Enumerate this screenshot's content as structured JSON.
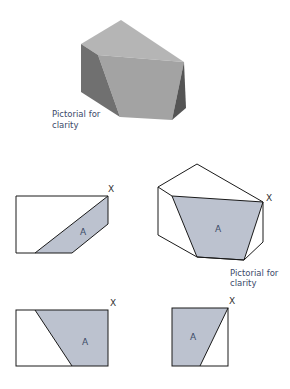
{
  "pictorial": {
    "caption_line1": "Pictorial for",
    "caption_line2": "clarity",
    "colors": {
      "top": "#b3b3b3",
      "front": "#a6a6a6",
      "left": "#6e6e6e",
      "right": "#5a5a5a"
    }
  },
  "views": {
    "front_view": {
      "area_label": "A",
      "corner_label": "X"
    },
    "isometric_view": {
      "area_label": "A",
      "corner_label": "X",
      "caption_line1": "Pictorial for",
      "caption_line2": "clarity"
    },
    "plan_view": {
      "area_label": "A",
      "corner_label": "X"
    },
    "end_view": {
      "area_label": "A",
      "corner_label": "X"
    }
  },
  "colors": {
    "shaded_face": "#bcc2cf",
    "outline": "#1a1a1a",
    "label": "#3a4a66"
  }
}
